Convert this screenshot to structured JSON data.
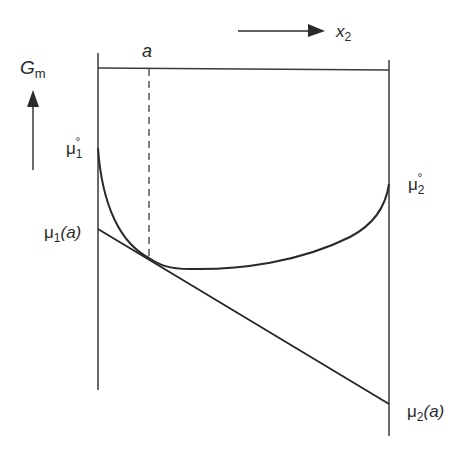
{
  "diagram": {
    "labels": {
      "a": "a",
      "x2_main": "x",
      "x2_sub": "2",
      "gm_main": "G",
      "gm_sub": "m",
      "mu1_std_main": "μ",
      "mu1_std_sub": "1",
      "mu1_std_sup": "°",
      "mu1_a_main": "μ",
      "mu1_a_sub": "1",
      "mu1_a_arg": "(a)",
      "mu2_std_main": "μ",
      "mu2_std_sub": "2",
      "mu2_std_sup": "°",
      "mu2_a_main": "μ",
      "mu2_a_sub": "2",
      "mu2_a_arg": "(a)"
    },
    "colors": {
      "line": "#2a2a2a",
      "background": "#ffffff"
    }
  }
}
